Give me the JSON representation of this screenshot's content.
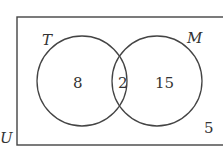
{
  "diagram": {
    "type": "venn",
    "universe_label": "U",
    "sets": [
      {
        "label": "T",
        "only": "8"
      },
      {
        "label": "M",
        "only": "15"
      }
    ],
    "intersection": "2",
    "outside": "5"
  }
}
